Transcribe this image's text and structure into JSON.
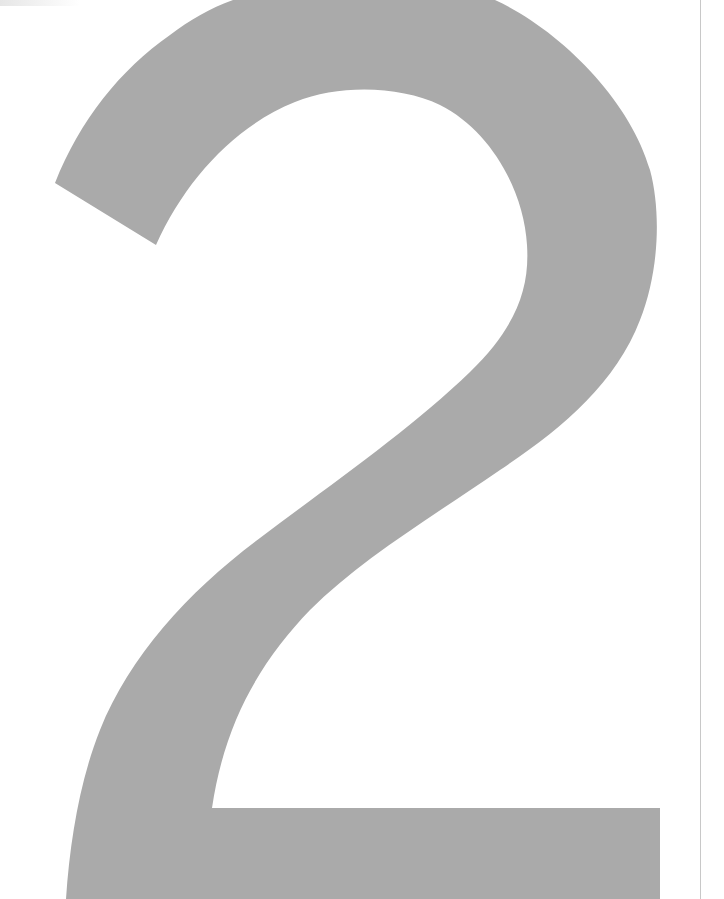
{
  "page": {
    "background_color": "#ffffff",
    "edge_line_color": "#c8c8c8"
  },
  "glyph": {
    "character": "2",
    "color": "#aaaaaa",
    "description": "Large gray numeral two filling the page"
  }
}
